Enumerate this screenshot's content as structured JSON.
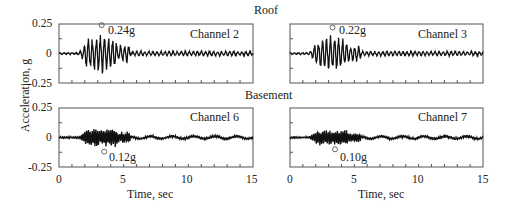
{
  "chart_data": [
    {
      "type": "line",
      "group": "Roof",
      "title": "Channel 2",
      "xlabel": "",
      "ylabel": "Acceleration, g",
      "xlim": [
        0,
        15
      ],
      "ylim": [
        -0.25,
        0.25
      ],
      "yticks": [
        "0.25",
        "0",
        "-0.25"
      ],
      "annotation": {
        "text": "0.24g",
        "x": 3.3,
        "y": 0.24
      },
      "peak": 0.24
    },
    {
      "type": "line",
      "group": "Roof",
      "title": "Channel 3",
      "xlim": [
        0,
        15
      ],
      "ylim": [
        -0.25,
        0.25
      ],
      "annotation": {
        "text": "0.22g",
        "x": 3.3,
        "y": 0.22
      },
      "peak": 0.22
    },
    {
      "type": "line",
      "group": "Basement",
      "title": "Channel 6",
      "xlabel": "Time, sec",
      "xlim": [
        0,
        15
      ],
      "ylim": [
        -0.25,
        0.25
      ],
      "xticks": [
        "0",
        "5",
        "10",
        "15"
      ],
      "yticks": [
        "0.25",
        "0",
        "-0.25"
      ],
      "annotation": {
        "text": "0.12g",
        "x": 3.5,
        "y": -0.12
      },
      "peak": -0.12
    },
    {
      "type": "line",
      "group": "Basement",
      "title": "Channel 7",
      "xlabel": "Time, sec",
      "xlim": [
        0,
        15
      ],
      "ylim": [
        -0.25,
        0.25
      ],
      "xticks": [
        "0",
        "5",
        "10",
        "15"
      ],
      "annotation": {
        "text": "0.10g",
        "x": 3.5,
        "y": -0.1
      },
      "peak": -0.1
    }
  ],
  "labels": {
    "roof": "Roof",
    "basement": "Basement",
    "ylabel": "Acceleration, g",
    "xlabel": "Time, sec",
    "ch2": "Channel 2",
    "ch3": "Channel 3",
    "ch6": "Channel 6",
    "ch7": "Channel 7",
    "ann2": "0.24g",
    "ann3": "0.22g",
    "ann6": "0.12g",
    "ann7": "0.10g",
    "ytick_top": "0.25",
    "ytick_mid": "0",
    "ytick_bot": "-0.25",
    "xt0": "0",
    "xt5": "5",
    "xt10": "10",
    "xt15": "15"
  }
}
